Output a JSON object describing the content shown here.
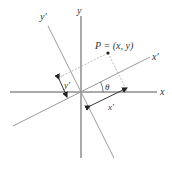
{
  "diagram": {
    "labels": {
      "x_axis": "x",
      "y_axis": "y",
      "x_prime_axis": "x′",
      "y_prime_axis": "y′",
      "point": "P = (x, y)",
      "x_prime_measure": "x′",
      "y_prime_measure": "y′",
      "angle": "θ"
    },
    "colors": {
      "axis": "#555555",
      "rotated_axis": "#9a9a9a",
      "dashed": "#aaaaaa",
      "point": "#222222",
      "text": "#333333"
    }
  }
}
